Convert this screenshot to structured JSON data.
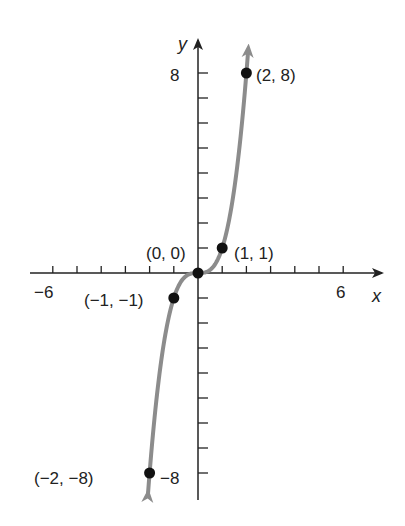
{
  "chart_data": {
    "type": "line",
    "title": "",
    "function": "y = x^3",
    "xlabel": "x",
    "ylabel": "y",
    "xlim": [
      -6,
      6
    ],
    "ylim": [
      -8,
      8
    ],
    "x_tick_labels": [
      "-6",
      "6"
    ],
    "y_tick_labels": [
      "8",
      "-8"
    ],
    "x_tick_step": 1,
    "y_tick_step": 1,
    "grid": false,
    "curve_color": "#8c8c8c",
    "points": [
      {
        "x": -2,
        "y": -8,
        "label": "(−2, −8)"
      },
      {
        "x": -1,
        "y": -1,
        "label": "(−1, −1)"
      },
      {
        "x": 0,
        "y": 0,
        "label": "(0, 0)"
      },
      {
        "x": 1,
        "y": 1,
        "label": "(1, 1)"
      },
      {
        "x": 2,
        "y": 8,
        "label": "(2, 8)"
      }
    ]
  },
  "labels": {
    "x_axis": "x",
    "y_axis": "y",
    "x_min": "−6",
    "x_max": "6",
    "y_max": "8",
    "y_min": "−8",
    "p_m2": "(−2, −8)",
    "p_m1": "(−1, −1)",
    "p_0": "(0, 0)",
    "p_1": "(1, 1)",
    "p_2": "(2, 8)"
  }
}
